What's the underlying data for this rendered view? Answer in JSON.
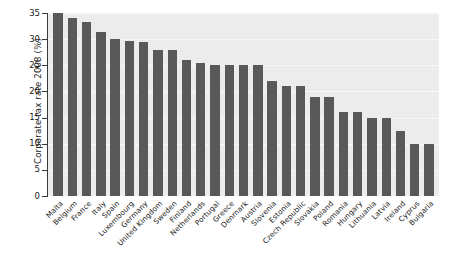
{
  "chart_data": {
    "type": "bar",
    "title": "",
    "xlabel": "",
    "ylabel": "Corporate tax rate 2008 (%)",
    "ylim": [
      0,
      35
    ],
    "yticks": [
      0,
      5,
      10,
      15,
      20,
      25,
      30,
      35
    ],
    "grid": true,
    "legend": "none",
    "bar_color": "#595959",
    "plot_background": "#ececec",
    "categories": [
      "Malta",
      "Belgium",
      "France",
      "Italy",
      "Spain",
      "Luxembourg",
      "Germany",
      "United Kingdom",
      "Sweden",
      "Finland",
      "Netherlands",
      "Portugal",
      "Greece",
      "Denmark",
      "Austria",
      "Slovenia",
      "Estonia",
      "Czech Republic",
      "Slovakia",
      "Poland",
      "Romania",
      "Hungary",
      "Lithuania",
      "Latvia",
      "Ireland",
      "Cyprus",
      "Bulgaria"
    ],
    "values": [
      35.0,
      34.0,
      33.3,
      31.4,
      30.0,
      29.6,
      29.5,
      28.0,
      28.0,
      26.0,
      25.5,
      25.0,
      25.0,
      25.0,
      25.0,
      22.0,
      21.0,
      21.0,
      19.0,
      19.0,
      16.0,
      16.0,
      15.0,
      15.0,
      12.5,
      10.0,
      10.0
    ]
  }
}
